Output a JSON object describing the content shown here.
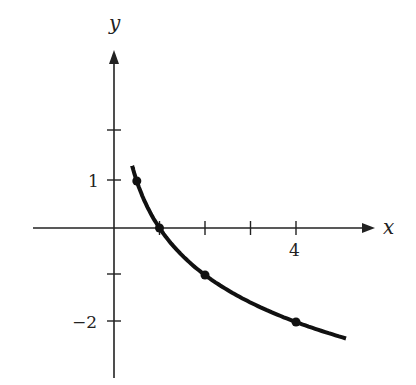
{
  "chart_data": {
    "type": "line",
    "title": "",
    "xlabel": "x",
    "ylabel": "y",
    "x_tick_labels": [
      "4"
    ],
    "y_tick_labels": [
      "1",
      "-2"
    ],
    "x_ticks": [
      1,
      2,
      3,
      4
    ],
    "y_ticks": [
      2,
      1,
      -1,
      -2
    ],
    "xlim": [
      -1.8,
      5.8
    ],
    "ylim": [
      -3.2,
      3.1
    ],
    "grid": false,
    "series": [
      {
        "name": "y = -log2(x)",
        "marked_points": [
          {
            "x": 0.5,
            "y": 1
          },
          {
            "x": 1,
            "y": 0
          },
          {
            "x": 2,
            "y": -1
          },
          {
            "x": 4,
            "y": -2
          }
        ],
        "curve_x_range": [
          0.4,
          5.1
        ]
      }
    ]
  },
  "labels": {
    "x_axis": "x",
    "y_axis": "y",
    "tick_4": "4",
    "tick_1": "1",
    "tick_neg2": "−2"
  }
}
